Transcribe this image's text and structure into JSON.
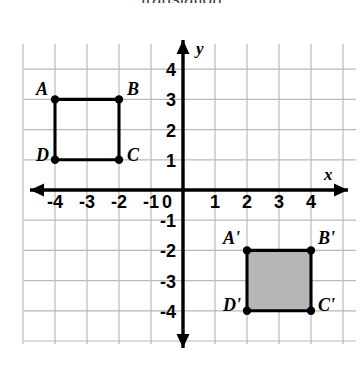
{
  "title": "translation",
  "figure": {
    "name": "coordinate-plane-translation",
    "axes": {
      "x_label": "x",
      "y_label": "y",
      "x_ticks": [
        "-4",
        "-3",
        "-2",
        "-1",
        "1",
        "2",
        "3",
        "4"
      ],
      "y_ticks": [
        "4",
        "3",
        "2",
        "1",
        "-1",
        "-2",
        "-3",
        "-4"
      ],
      "origin_label": "0",
      "x_range": [
        -4.75,
        5.1
      ],
      "y_range": [
        -5.1,
        5.1
      ]
    },
    "colors": {
      "grid": "#b9b9b9",
      "axis": "#000000",
      "shape_stroke": "#000000",
      "shape_fill_preimage": "none",
      "shape_fill_image": "#b6b6b6",
      "text": "#000000",
      "background": "#ffffff"
    },
    "shapes": [
      {
        "name": "square-ABCD",
        "kind": "preimage",
        "filled": false,
        "vertices": [
          {
            "label": "A",
            "x": -4,
            "y": 3,
            "label_dx": -19,
            "label_dy": -4
          },
          {
            "label": "B",
            "x": -2,
            "y": 3,
            "label_dx": 8,
            "label_dy": -4
          },
          {
            "label": "C",
            "x": -2,
            "y": 1,
            "label_dx": 8,
            "label_dy": 1
          },
          {
            "label": "D",
            "x": -4,
            "y": 1,
            "label_dx": -19,
            "label_dy": 1
          }
        ]
      },
      {
        "name": "square-A-prime-B-prime-C-prime-D-prime",
        "kind": "image",
        "filled": true,
        "vertices": [
          {
            "label": "A'",
            "x": 2,
            "y": -2,
            "label_dx": -24,
            "label_dy": -6
          },
          {
            "label": "B'",
            "x": 4,
            "y": -2,
            "label_dx": 7,
            "label_dy": -6
          },
          {
            "label": "C'",
            "x": 4,
            "y": -4,
            "label_dx": 7,
            "label_dy": 0
          },
          {
            "label": "D'",
            "x": 2,
            "y": -4,
            "label_dx": -24,
            "label_dy": 0
          }
        ]
      }
    ]
  }
}
